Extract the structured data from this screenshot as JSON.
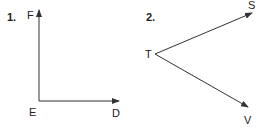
{
  "figures": [
    {
      "number": "1.",
      "labels": {
        "top": "F",
        "vertex": "E",
        "right": "D"
      },
      "description": "Right angle DEF with rays ED and EF"
    },
    {
      "number": "2.",
      "labels": {
        "vertex": "T",
        "upper": "S",
        "lower": "V"
      },
      "description": "Angle STV with rays TS and TV"
    }
  ],
  "colors": {
    "stroke": "#333333",
    "text": "#222222"
  }
}
